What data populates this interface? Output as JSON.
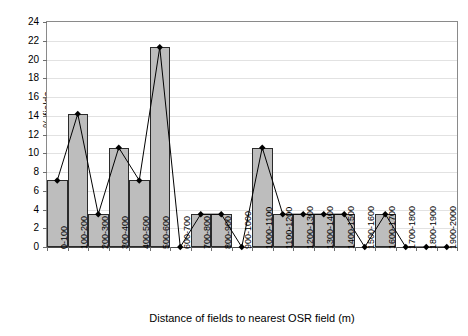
{
  "chart_data": {
    "type": "bar",
    "title": "",
    "subtitle": "",
    "xlabel": "Distance of fields to nearest OSR field (m)",
    "ylabel": "% fields",
    "ylim": [
      0,
      24
    ],
    "ytick_step": 2,
    "yticks": [
      0,
      2,
      4,
      6,
      8,
      10,
      12,
      14,
      16,
      18,
      20,
      22,
      24
    ],
    "grid": true,
    "legend": "none",
    "overlay": {
      "type": "line",
      "name": "% fields",
      "marker": "diamond",
      "marker_color": "#000000",
      "line_color": "#000000"
    },
    "bar_fill": "#bdbdbd",
    "bar_edge": "#2b2b2b",
    "categories": [
      "0-100",
      "100-200",
      "200-300",
      "300-400",
      "400-500",
      "500-600",
      "600-700",
      "700-800",
      "800-900",
      "900-1000",
      "1000-1100",
      "1100-1200",
      "1200-1300",
      "1300-1400",
      "1400-1500",
      "1500-1600",
      "1600-1700",
      "1700-1800",
      "1800-1900",
      "1900-2000"
    ],
    "values": [
      7.1,
      14.2,
      3.5,
      10.6,
      7.1,
      21.3,
      0,
      3.5,
      3.5,
      0,
      10.6,
      3.5,
      3.5,
      3.5,
      3.5,
      0,
      3.5,
      0,
      0,
      0
    ]
  }
}
